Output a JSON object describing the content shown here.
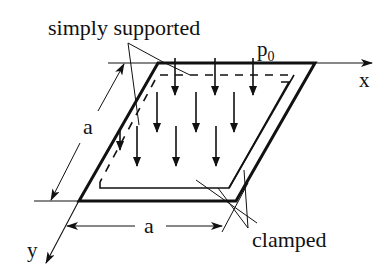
{
  "diagram": {
    "labels": {
      "simply_supported": "simply supported",
      "clamped": "clamped",
      "load": "p",
      "load_subscript": "0",
      "x_axis": "x",
      "y_axis": "y",
      "side_left": "a",
      "side_bottom": "a"
    },
    "colors": {
      "stroke": "#111111",
      "background": "#ffffff"
    },
    "load_arrows_count": 10
  }
}
